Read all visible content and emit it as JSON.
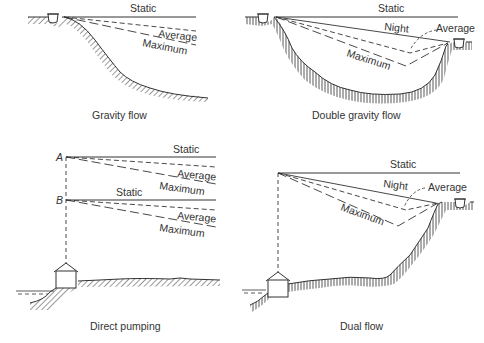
{
  "panels": [
    {
      "id": "gravity-flow",
      "caption": "Gravity flow",
      "labels": {
        "static": "Static",
        "average": "Average",
        "maximum": "Maximum"
      }
    },
    {
      "id": "double-gravity-flow",
      "caption": "Double gravity flow",
      "labels": {
        "static": "Static",
        "night": "Night",
        "average": "Average",
        "maximum": "Maximum"
      }
    },
    {
      "id": "direct-pumping",
      "caption": "Direct pumping",
      "labels": {
        "point_a": "A",
        "point_b": "B",
        "a_static": "Static",
        "a_average": "Average",
        "a_maximum": "Maximum",
        "b_static": "Static",
        "b_average": "Average",
        "b_maximum": "Maximum"
      }
    },
    {
      "id": "dual-flow",
      "caption": "Dual flow",
      "labels": {
        "static": "Static",
        "night": "Night",
        "average": "Average",
        "maximum": "Maximum"
      }
    }
  ],
  "colors": {
    "line": "#333333",
    "background": "#ffffff"
  }
}
